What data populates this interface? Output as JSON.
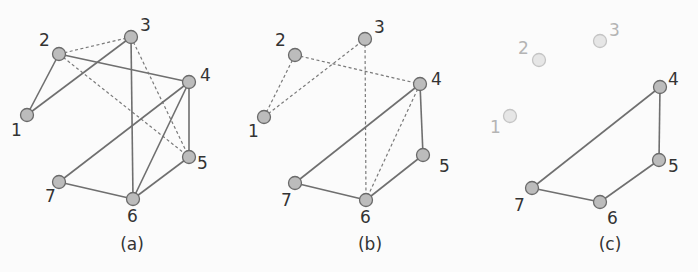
{
  "figure": {
    "panels": [
      {
        "id": "a",
        "caption": "(a)",
        "caption_pos": [
          132,
          250
        ],
        "nodes": [
          {
            "id": "1",
            "x": 27,
            "y": 115,
            "lx": 11,
            "ly": 136,
            "faded": false
          },
          {
            "id": "2",
            "x": 59,
            "y": 54,
            "lx": 39,
            "ly": 46,
            "faded": false
          },
          {
            "id": "3",
            "x": 131,
            "y": 37,
            "lx": 140,
            "ly": 31,
            "faded": false
          },
          {
            "id": "4",
            "x": 189,
            "y": 82,
            "lx": 200,
            "ly": 81,
            "faded": false
          },
          {
            "id": "5",
            "x": 189,
            "y": 157,
            "lx": 197,
            "ly": 169,
            "faded": false
          },
          {
            "id": "6",
            "x": 133,
            "y": 199,
            "lx": 127,
            "ly": 222,
            "faded": false
          },
          {
            "id": "7",
            "x": 59,
            "y": 182,
            "lx": 45,
            "ly": 202,
            "faded": false
          }
        ],
        "edges": [
          {
            "from": "1",
            "to": "2",
            "style": "solid"
          },
          {
            "from": "1",
            "to": "3",
            "style": "solid"
          },
          {
            "from": "2",
            "to": "4",
            "style": "solid"
          },
          {
            "from": "2",
            "to": "3",
            "style": "dashed"
          },
          {
            "from": "2",
            "to": "5",
            "style": "dashed"
          },
          {
            "from": "3",
            "to": "5",
            "style": "dashed"
          },
          {
            "from": "3",
            "to": "6",
            "style": "solid"
          },
          {
            "from": "4",
            "to": "5",
            "style": "solid"
          },
          {
            "from": "4",
            "to": "6",
            "style": "solid"
          },
          {
            "from": "4",
            "to": "7",
            "style": "solid"
          },
          {
            "from": "5",
            "to": "6",
            "style": "solid"
          },
          {
            "from": "6",
            "to": "7",
            "style": "solid"
          }
        ]
      },
      {
        "id": "b",
        "caption": "(b)",
        "caption_pos": [
          370,
          250
        ],
        "nodes": [
          {
            "id": "1",
            "x": 264,
            "y": 117,
            "lx": 248,
            "ly": 137,
            "faded": false
          },
          {
            "id": "2",
            "x": 295,
            "y": 55,
            "lx": 275,
            "ly": 46,
            "faded": false
          },
          {
            "id": "3",
            "x": 365,
            "y": 39,
            "lx": 374,
            "ly": 33,
            "faded": false
          },
          {
            "id": "4",
            "x": 420,
            "y": 84,
            "lx": 431,
            "ly": 85,
            "faded": false
          },
          {
            "id": "5",
            "x": 423,
            "y": 155,
            "lx": 439,
            "ly": 172,
            "faded": false
          },
          {
            "id": "6",
            "x": 366,
            "y": 200,
            "lx": 360,
            "ly": 223,
            "faded": false
          },
          {
            "id": "7",
            "x": 295,
            "y": 183,
            "lx": 281,
            "ly": 206,
            "faded": false
          }
        ],
        "edges": [
          {
            "from": "1",
            "to": "2",
            "style": "dashed"
          },
          {
            "from": "1",
            "to": "3",
            "style": "dashed"
          },
          {
            "from": "2",
            "to": "4",
            "style": "dashed"
          },
          {
            "from": "3",
            "to": "6",
            "style": "dashed"
          },
          {
            "from": "4",
            "to": "6",
            "style": "dashed"
          },
          {
            "from": "4",
            "to": "5",
            "style": "solid"
          },
          {
            "from": "4",
            "to": "7",
            "style": "solid"
          },
          {
            "from": "5",
            "to": "6",
            "style": "solid"
          },
          {
            "from": "6",
            "to": "7",
            "style": "solid"
          }
        ]
      },
      {
        "id": "c",
        "caption": "(c)",
        "caption_pos": [
          610,
          250
        ],
        "nodes": [
          {
            "id": "1",
            "x": 510,
            "y": 116,
            "lx": 490,
            "ly": 133,
            "faded": true
          },
          {
            "id": "2",
            "x": 539,
            "y": 60,
            "lx": 518,
            "ly": 54,
            "faded": true
          },
          {
            "id": "3",
            "x": 600,
            "y": 41,
            "lx": 609,
            "ly": 36,
            "faded": true
          },
          {
            "id": "4",
            "x": 660,
            "y": 87,
            "lx": 668,
            "ly": 85,
            "faded": false
          },
          {
            "id": "5",
            "x": 659,
            "y": 160,
            "lx": 668,
            "ly": 172,
            "faded": false
          },
          {
            "id": "6",
            "x": 600,
            "y": 202,
            "lx": 607,
            "ly": 224,
            "faded": false
          },
          {
            "id": "7",
            "x": 532,
            "y": 188,
            "lx": 514,
            "ly": 211,
            "faded": false
          }
        ],
        "edges": [
          {
            "from": "4",
            "to": "5",
            "style": "solid"
          },
          {
            "from": "4",
            "to": "7",
            "style": "solid"
          },
          {
            "from": "5",
            "to": "6",
            "style": "solid"
          },
          {
            "from": "6",
            "to": "7",
            "style": "solid"
          }
        ]
      }
    ],
    "node_radius": 6.5,
    "colors": {
      "background": "#fbfbfb",
      "node_fill": "#bcbcbc",
      "node_stroke": "#6a6a6a",
      "faded_node_fill": "#e6e6e6",
      "edge": "#6f6f6f",
      "label": "#333333",
      "faded_label": "#b4b4b4"
    }
  }
}
